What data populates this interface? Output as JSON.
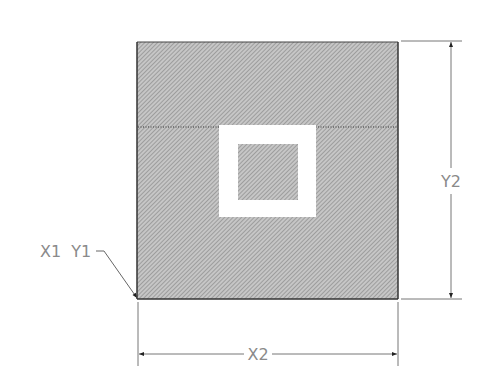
{
  "diagram": {
    "type": "technical-drawing",
    "labels": {
      "origin": "X1  Y1",
      "width": "X2",
      "height": "Y2"
    },
    "colors": {
      "hatch_fill": "#b4b4b4",
      "hatch_line": "#8c8c8c",
      "outline": "#333333",
      "dimension_line": "#777777",
      "label": "#8a8a8a",
      "cutout": "#ffffff"
    },
    "geometry": {
      "outer_square": {
        "x": 137,
        "y": 42,
        "w": 261,
        "h": 257
      },
      "white_frame": {
        "x": 219,
        "y": 125,
        "w": 97,
        "h": 92
      },
      "inner_square": {
        "x": 238,
        "y": 144,
        "w": 60,
        "h": 56
      },
      "dotted_line_y": 127
    }
  }
}
